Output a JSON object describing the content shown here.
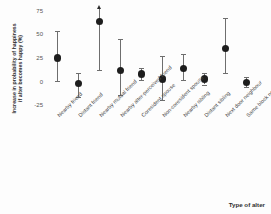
{
  "chart_data": {
    "type": "scatter",
    "title": "",
    "xlabel": "Type of alter",
    "ylabel": "Increase in probability of happiness if alter becomes happy (%)",
    "ylabel_line1": "Increase in probability of happiness",
    "ylabel_line2": "if alter becomes happy (%)",
    "ylim": [
      -30,
      78
    ],
    "yticks": [
      75,
      50,
      25,
      0,
      -25
    ],
    "ytick_labels": [
      "75",
      "50",
      "25",
      "0",
      "-25"
    ],
    "grid": false,
    "legend": null,
    "error_bars": "95% confidence interval",
    "categories": [
      "Nearby friend",
      "Distant friend",
      "Nearby mutual friend",
      "Nearby alter-perceived friend",
      "Coresident spouse",
      "Non-coresident spouse",
      "Nearby sibling",
      "Distant sibling",
      "Next door neighbour",
      "Same block neighbour"
    ],
    "values": [
      25,
      -2,
      64,
      12,
      8,
      3,
      14,
      3,
      35,
      -1
    ],
    "ci_low": [
      1,
      -16,
      12,
      -14,
      2,
      -19,
      2,
      -3,
      9,
      -6
    ],
    "ci_high": [
      54,
      9,
      78,
      45,
      15,
      27,
      29,
      9,
      67,
      5
    ],
    "ci_high_truncated": [
      false,
      false,
      true,
      false,
      false,
      false,
      false,
      false,
      false,
      false
    ],
    "marker": "filled-circle",
    "marker_color": "#1d1d1d",
    "errorbar_color": "#6e6e6e"
  }
}
